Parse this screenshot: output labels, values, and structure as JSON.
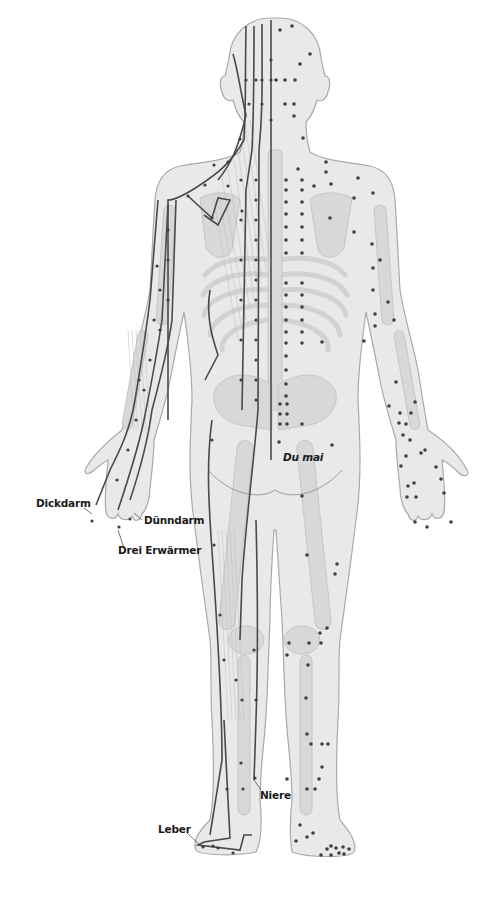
{
  "figure": {
    "view": "posterior",
    "colors": {
      "background": "#ffffff",
      "body_fill": "#e9e9e9",
      "body_outline": "#a9a9a9",
      "bone_fill": "#d8d8d8",
      "muscle_line": "#c4c4c4",
      "meridian_line": "#4a4a4a",
      "point": "#3f3f3f",
      "label_text": "#1a1a1a"
    }
  },
  "labels": {
    "dickdarm": "Dickdarm",
    "duenndarm": "Dünndarm",
    "drei_erwaermer": "Drei Erwärmer",
    "du_mai": "Du mai",
    "niere": "Niere",
    "leber": "Leber"
  },
  "meridians": [
    {
      "name": "Du mai",
      "side": "midline"
    },
    {
      "name": "Dickdarm",
      "side": "left-arm"
    },
    {
      "name": "Dünndarm",
      "side": "left-arm"
    },
    {
      "name": "Drei Erwärmer",
      "side": "left-arm"
    },
    {
      "name": "Niere",
      "side": "left-leg"
    },
    {
      "name": "Leber",
      "side": "left-foot"
    }
  ]
}
